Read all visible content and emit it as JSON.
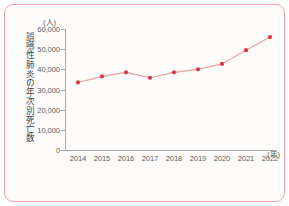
{
  "chart_data": {
    "type": "line",
    "title": "",
    "subtitle": "",
    "xlabel": "(年)",
    "ylabel": "誤嚥性肺炎の年次別死亡数",
    "yunit": "(人)",
    "categories": [
      "2014",
      "2015",
      "2016",
      "2017",
      "2018",
      "2019",
      "2020",
      "2021",
      "2022"
    ],
    "values": [
      33500,
      36500,
      38500,
      35800,
      38500,
      40000,
      42700,
      49500,
      56000
    ],
    "series": [
      {
        "name": "誤嚥性肺炎の年次別死亡数",
        "values": [
          33500,
          36500,
          38500,
          35800,
          38500,
          40000,
          42700,
          49500,
          56000
        ]
      }
    ],
    "ylim": [
      0,
      60000
    ],
    "yticks": [
      0,
      10000,
      20000,
      30000,
      40000,
      50000,
      60000
    ],
    "ytick_labels": [
      "0",
      "10,000",
      "20,000",
      "30,000",
      "40,000",
      "50,000",
      "60,000"
    ],
    "xtick_labels": [
      "2014",
      "2015",
      "2016",
      "2017",
      "2018",
      "2019",
      "2020",
      "2021",
      "2022"
    ],
    "grid": false,
    "legend": "none",
    "marker": "circle",
    "line_color": "#e8a0a0",
    "marker_color": "#d9384a",
    "frame_color": "#eda0a8",
    "axis_color": "#a9a9a9",
    "background": "#fdfcfa"
  }
}
